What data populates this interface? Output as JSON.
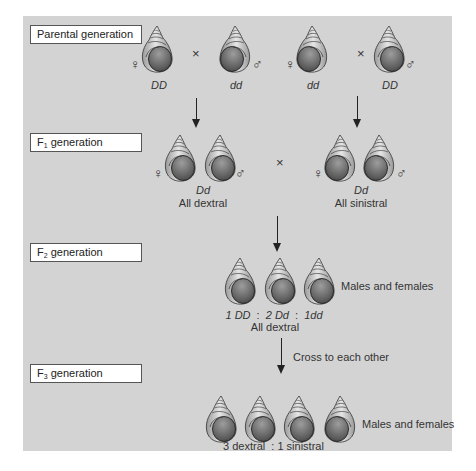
{
  "colors": {
    "panel": "#d3d3d3",
    "shell_light": "#eeeeee",
    "shell_dark": "#555555",
    "outline": "#333333"
  },
  "generations": {
    "parental": {
      "label": "Parental generation",
      "crosses": [
        {
          "female": {
            "genotype": "DD",
            "coil": "dextral"
          },
          "male": {
            "genotype": "dd",
            "coil": "sinistral"
          },
          "symbol": "×"
        },
        {
          "female": {
            "genotype": "dd",
            "coil": "sinistral"
          },
          "male": {
            "genotype": "DD",
            "coil": "dextral"
          },
          "symbol": "×"
        }
      ]
    },
    "f1": {
      "label_prefix": "F",
      "label_sub": "1",
      "label_suffix": " generation",
      "left": {
        "genotype": "Dd",
        "phenotype": "All dextral"
      },
      "right": {
        "genotype": "Dd",
        "phenotype": "All sinistral"
      },
      "symbol": "×"
    },
    "f2": {
      "label_prefix": "F",
      "label_sub": "2",
      "label_suffix": " generation",
      "ratio": {
        "a": "1 DD",
        "sep1": ":",
        "b": "2 Dd",
        "sep2": ":",
        "c": "1dd"
      },
      "phenotype": "All dextral",
      "note": "Males and females"
    },
    "f3": {
      "label_prefix": "F",
      "label_sub": "3",
      "label_suffix": " generation",
      "arrow_note": "Cross to each other",
      "ratio": "3 dextral  : 1 sinistral",
      "note": "Males and females"
    }
  },
  "symbols": {
    "female": "♀",
    "male": "♂"
  }
}
